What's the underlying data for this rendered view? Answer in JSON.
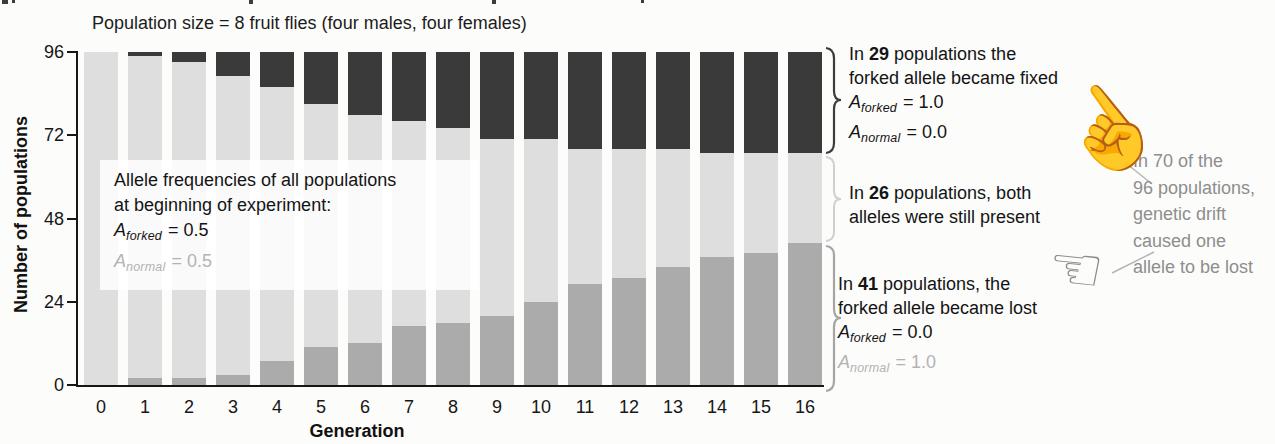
{
  "chart_data": {
    "type": "bar",
    "stacked": true,
    "title": "Population size = 8 fruit flies (four males, four females)",
    "xlabel": "Generation",
    "ylabel": "Number of populations",
    "ylim": [
      0,
      96
    ],
    "yticks": [
      0,
      24,
      48,
      72,
      96
    ],
    "grid": false,
    "legend_position": "none",
    "categories": [
      "0",
      "1",
      "2",
      "3",
      "4",
      "5",
      "6",
      "7",
      "8",
      "9",
      "10",
      "11",
      "12",
      "13",
      "14",
      "15",
      "16"
    ],
    "series": [
      {
        "name": "forked allele fixed",
        "color": "#3a3a3a",
        "values": [
          0,
          1,
          3,
          7,
          10,
          15,
          18,
          20,
          22,
          25,
          25,
          28,
          28,
          28,
          29,
          29,
          29
        ]
      },
      {
        "name": "both alleles present",
        "color": "#dedede",
        "values": [
          96,
          93,
          91,
          86,
          79,
          70,
          66,
          59,
          56,
          51,
          47,
          39,
          37,
          34,
          30,
          29,
          26
        ]
      },
      {
        "name": "forked allele lost",
        "color": "#ababab",
        "values": [
          0,
          2,
          2,
          3,
          7,
          11,
          12,
          17,
          18,
          20,
          24,
          29,
          31,
          34,
          37,
          38,
          41
        ]
      }
    ]
  },
  "info_box": {
    "line1": "Allele frequencies of all populations",
    "line2": "at beginning of experiment:",
    "forked_symbol": "A",
    "forked_sub": "forked",
    "forked_eq": "= 0.5",
    "normal_symbol": "A",
    "normal_sub": "normal",
    "normal_eq": "= 0.5"
  },
  "annotations": {
    "fixed": {
      "lead": "In",
      "count": "29",
      "line1_rest": "populations the",
      "line2": "forked allele became fixed",
      "forked_symbol": "A",
      "forked_sub": "forked",
      "forked_eq": "= 1.0",
      "normal_symbol": "A",
      "normal_sub": "normal",
      "normal_eq": "= 0.0"
    },
    "both": {
      "lead": "In",
      "count": "26",
      "line1_rest": "populations, both",
      "line2": "alleles were still present"
    },
    "lost": {
      "lead": "In",
      "count": "41",
      "line1_rest": "populations, the",
      "line2": "forked allele became lost",
      "forked_symbol": "A",
      "forked_sub": "forked",
      "forked_eq": "= 0.0",
      "normal_symbol": "A",
      "normal_sub": "normal",
      "normal_eq": "= 1.0"
    },
    "drift_note": {
      "lines": [
        "In 70 of the",
        "96 populations,",
        "genetic drift",
        "caused one",
        "allele to be lost"
      ]
    }
  },
  "icons": {
    "hand_up_glyph": "☝",
    "hand_left_glyph": "☜"
  },
  "colors": {
    "bar_fixed": "#3a3a3a",
    "bar_both": "#dedede",
    "bar_lost": "#ababab",
    "axis": "#161616",
    "gray_text": "#8e8e8e",
    "light_gray_text": "#b3b3b3"
  }
}
